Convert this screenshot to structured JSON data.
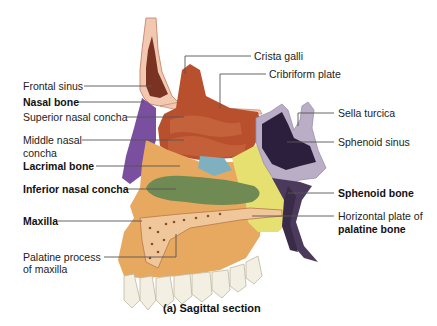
{
  "figure": {
    "caption": "(a) Sagittal section",
    "labels_left": [
      {
        "id": "frontal-sinus",
        "text": "Frontal sinus",
        "bold": false
      },
      {
        "id": "nasal-bone",
        "text": "Nasal bone",
        "bold": true
      },
      {
        "id": "superior-nasal-concha",
        "text": "Superior nasal concha",
        "bold": false
      },
      {
        "id": "middle-nasal-concha",
        "text": "Middle nasal",
        "text2": "concha",
        "bold": false
      },
      {
        "id": "lacrimal-bone",
        "text": "Lacrimal bone",
        "bold": true
      },
      {
        "id": "inferior-nasal-concha",
        "text": "Inferior nasal concha",
        "bold": true
      },
      {
        "id": "maxilla",
        "text": "Maxilla",
        "bold": true
      },
      {
        "id": "palatine-process",
        "text": "Palatine process",
        "text2": "of maxilla",
        "bold": false
      }
    ],
    "labels_right": [
      {
        "id": "crista-galli",
        "text": "Crista galli",
        "bold": false
      },
      {
        "id": "cribriform-plate",
        "text": "Cribriform plate",
        "bold": false
      },
      {
        "id": "sella-turcica",
        "text": "Sella turcica",
        "bold": false
      },
      {
        "id": "sphenoid-sinus",
        "text": "Sphenoid sinus",
        "bold": false
      },
      {
        "id": "sphenoid-bone",
        "text": "Sphenoid bone",
        "bold": true
      },
      {
        "id": "horizontal-plate",
        "text": "Horizontal plate of",
        "text2": "palatine bone",
        "bold": false,
        "bold2": true
      }
    ],
    "colors": {
      "frontal_bone": "#f2c9b0",
      "frontal_sinus": "#7a3322",
      "ethmoid": "#b8502e",
      "nasal_bone": "#7a4fa0",
      "lacrimal": "#7fb0c0",
      "inferior_concha": "#6f8a52",
      "maxilla": "#e7a860",
      "palatine": "#e6e070",
      "sphenoid_sinus": "#2c1f3d",
      "sphenoid_bone": "#4c3a5c",
      "sphenoid_spongy": "#b9aec6",
      "teeth": "#f3efe2",
      "leader": "#555555"
    }
  }
}
